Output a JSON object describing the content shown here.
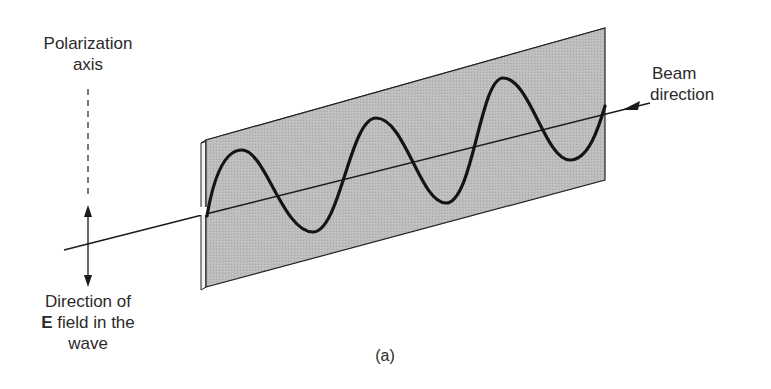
{
  "figure": {
    "caption": "(a)",
    "labels": {
      "polarization_axis_line1": "Polarization",
      "polarization_axis_line2": "axis",
      "beam_direction_line1": "Beam",
      "beam_direction_line2": "direction",
      "efield_line1": "Direction of",
      "efield_bold": "E",
      "efield_line2_rest": " field in the",
      "efield_line3": "wave"
    },
    "colors": {
      "panel_fill": "#b9b9b9",
      "panel_edge": "#e8e8e8",
      "stroke": "#1a1a1a",
      "background": "#ffffff"
    },
    "elements": {
      "polarizer_panel": "Polarizing sheet (slanted plate)",
      "wave": "Sinusoidal E-field wave, 3 full cycles",
      "beam_line": "Beam axis with arrowhead",
      "polarization_axis": "Vertical dashed line",
      "efield_arrow": "Double-headed vertical arrow"
    }
  }
}
